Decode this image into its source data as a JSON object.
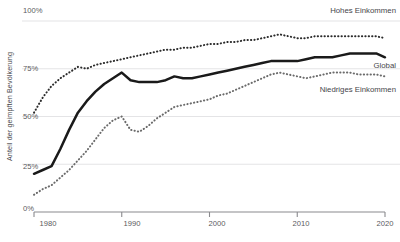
{
  "chart_data": {
    "type": "line",
    "title": "",
    "xlabel": "",
    "ylabel": "Anteil der geimpften Bevölkerung",
    "xlim": [
      1980,
      2020
    ],
    "ylim": [
      0,
      100
    ],
    "grid": true,
    "legend_position": "right-inline",
    "y_ticks": [
      "0%",
      "25%",
      "50%",
      "75%",
      "100%"
    ],
    "y_tick_values": [
      0,
      25,
      50,
      75,
      100
    ],
    "x_ticks": [
      "1980",
      "1990",
      "2000",
      "2010",
      "2020"
    ],
    "x_tick_values": [
      1980,
      1990,
      2000,
      2010,
      2020
    ],
    "x": [
      1980,
      1981,
      1982,
      1983,
      1984,
      1985,
      1986,
      1987,
      1988,
      1989,
      1990,
      1991,
      1992,
      1993,
      1994,
      1995,
      1996,
      1997,
      1998,
      1999,
      2000,
      2001,
      2002,
      2003,
      2004,
      2005,
      2006,
      2007,
      2008,
      2009,
      2010,
      2011,
      2012,
      2013,
      2014,
      2015,
      2016,
      2017,
      2018,
      2019,
      2020
    ],
    "series": [
      {
        "name": "Hohes Einkommen",
        "style": "dotted",
        "color": "#2b2b2b",
        "values": [
          52,
          60,
          66,
          70,
          73,
          76,
          75,
          77,
          78,
          79,
          80,
          81,
          82,
          83,
          84,
          85,
          85,
          86,
          86,
          87,
          88,
          88,
          89,
          89,
          90,
          90,
          91,
          92,
          93,
          92,
          91,
          91,
          92,
          92,
          92,
          92,
          92,
          92,
          92,
          92,
          91
        ]
      },
      {
        "name": "Global",
        "style": "solid",
        "color": "#1a1a1a",
        "values": [
          20,
          22,
          24,
          33,
          43,
          52,
          58,
          63,
          67,
          70,
          73,
          69,
          68,
          68,
          68,
          69,
          71,
          70,
          70,
          71,
          72,
          73,
          74,
          75,
          76,
          77,
          78,
          79,
          79,
          79,
          79,
          80,
          81,
          81,
          81,
          82,
          83,
          83,
          83,
          83,
          81
        ]
      },
      {
        "name": "Niedriges Einkommen",
        "style": "dotted",
        "color": "#6b6b6b",
        "values": [
          9,
          12,
          14,
          18,
          22,
          27,
          32,
          38,
          44,
          48,
          50,
          43,
          42,
          45,
          49,
          52,
          55,
          56,
          57,
          58,
          59,
          61,
          62,
          64,
          66,
          68,
          70,
          72,
          73,
          72,
          71,
          70,
          71,
          72,
          73,
          73,
          73,
          72,
          72,
          72,
          71
        ]
      }
    ],
    "annotations": [
      {
        "text": "Hohes Einkommen",
        "x": 2020,
        "y": 100
      },
      {
        "text": "Global",
        "x": 2020,
        "y": 74
      },
      {
        "text": "Niedriges Einkommen",
        "x": 2020,
        "y": 62
      }
    ]
  },
  "axis_colors": {
    "gridline": "#e4e4e6",
    "axis": "#8a8a8e",
    "text": "#5a5a5e"
  }
}
